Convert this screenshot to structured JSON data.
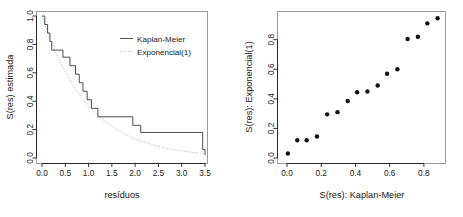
{
  "figure": {
    "background": "#ffffff",
    "foreground": "#1a1a1a",
    "frame_color": "#9a9a9a",
    "series_solid_color": "#4d4d4d",
    "series_dotted_color": "#b5b5b5",
    "point_color": "#111111"
  },
  "chart_data": [
    {
      "type": "line",
      "panel": "left",
      "title": "",
      "xlabel": "resíduos",
      "ylabel": "S(res) estimada",
      "xlim": [
        0.0,
        3.5
      ],
      "ylim": [
        0.0,
        1.0
      ],
      "xticks": [
        "0.0",
        "0.5",
        "1.0",
        "1.5",
        "2.0",
        "2.5",
        "3.0",
        "3.5"
      ],
      "xtick_values": [
        0.0,
        0.5,
        1.0,
        1.5,
        2.0,
        2.5,
        3.0,
        3.5
      ],
      "yticks": [
        "0.0",
        "0.2",
        "0.4",
        "0.6",
        "0.8",
        "1.0"
      ],
      "ytick_values": [
        0.0,
        0.2,
        0.4,
        0.6,
        0.8,
        1.0
      ],
      "grid": false,
      "legend_position": "top-right",
      "legend": [
        {
          "label": "Kaplan-Meier",
          "style": "solid"
        },
        {
          "label": "Exponencial(1)",
          "style": "dotted"
        }
      ],
      "series": [
        {
          "name": "Kaplan-Meier",
          "style": "step",
          "x": [
            0.0,
            0.03,
            0.06,
            0.12,
            0.17,
            0.21,
            0.45,
            0.52,
            0.6,
            0.72,
            0.8,
            0.88,
            0.97,
            1.06,
            1.2,
            1.95,
            2.12,
            3.45,
            3.5
          ],
          "y": [
            1.0,
            1.0,
            0.94,
            0.88,
            0.82,
            0.76,
            0.71,
            0.71,
            0.65,
            0.59,
            0.53,
            0.47,
            0.41,
            0.35,
            0.29,
            0.23,
            0.18,
            0.06,
            0.02
          ]
        },
        {
          "name": "Exponencial(1)",
          "style": "dotted",
          "x": [
            0.0,
            0.1,
            0.2,
            0.3,
            0.4,
            0.5,
            0.6,
            0.7,
            0.8,
            0.9,
            1.0,
            1.2,
            1.4,
            1.6,
            1.8,
            2.0,
            2.2,
            2.4,
            2.6,
            2.8,
            3.0,
            3.2,
            3.4,
            3.5
          ],
          "y": [
            1.0,
            0.905,
            0.819,
            0.741,
            0.67,
            0.607,
            0.549,
            0.497,
            0.449,
            0.407,
            0.368,
            0.301,
            0.247,
            0.202,
            0.165,
            0.135,
            0.111,
            0.091,
            0.074,
            0.061,
            0.05,
            0.041,
            0.033,
            0.03
          ]
        }
      ]
    },
    {
      "type": "scatter",
      "panel": "right",
      "title": "",
      "xlabel": "S(res): Kaplan-Meier",
      "ylabel": "S(res): Exponencial(1)",
      "xlim": [
        0.0,
        0.9
      ],
      "ylim": [
        0.0,
        0.96
      ],
      "xticks": [
        "0.0",
        "0.2",
        "0.4",
        "0.6",
        "0.8"
      ],
      "xtick_values": [
        0.0,
        0.2,
        0.4,
        0.6,
        0.8
      ],
      "yticks": [
        "0.0",
        "0.2",
        "0.4",
        "0.6",
        "0.8"
      ],
      "ytick_values": [
        0.0,
        0.2,
        0.4,
        0.6,
        0.8
      ],
      "grid": false,
      "points": [
        {
          "x": 0.005,
          "y": 0.03
        },
        {
          "x": 0.06,
          "y": 0.12
        },
        {
          "x": 0.115,
          "y": 0.12
        },
        {
          "x": 0.175,
          "y": 0.145
        },
        {
          "x": 0.235,
          "y": 0.295
        },
        {
          "x": 0.295,
          "y": 0.31
        },
        {
          "x": 0.355,
          "y": 0.385
        },
        {
          "x": 0.41,
          "y": 0.445
        },
        {
          "x": 0.47,
          "y": 0.45
        },
        {
          "x": 0.53,
          "y": 0.49
        },
        {
          "x": 0.585,
          "y": 0.57
        },
        {
          "x": 0.645,
          "y": 0.6
        },
        {
          "x": 0.705,
          "y": 0.805
        },
        {
          "x": 0.765,
          "y": 0.82
        },
        {
          "x": 0.82,
          "y": 0.91
        },
        {
          "x": 0.88,
          "y": 0.945
        }
      ]
    }
  ]
}
